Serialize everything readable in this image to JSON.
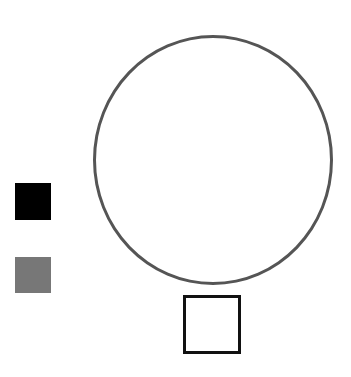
{
  "canvas": {
    "width": 351,
    "height": 377,
    "background": "#ffffff"
  },
  "shapes": {
    "circle": {
      "type": "circle-outline",
      "left": 93,
      "top": 35,
      "width": 240,
      "height": 250,
      "stroke": "#555555",
      "stroke_width": 3
    },
    "black_square": {
      "type": "square-filled",
      "left": 15,
      "top": 183,
      "width": 36,
      "height": 37,
      "fill": "#000000"
    },
    "gray_square": {
      "type": "square-filled",
      "left": 15,
      "top": 257,
      "width": 36,
      "height": 36,
      "fill": "#777777"
    },
    "outline_square": {
      "type": "square-outline",
      "left": 183,
      "top": 295,
      "width": 58,
      "height": 59,
      "stroke": "#111111",
      "stroke_width": 3
    }
  }
}
